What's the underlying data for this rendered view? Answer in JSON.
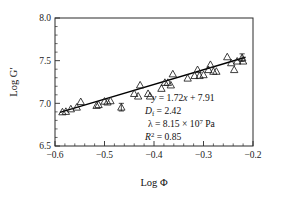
{
  "chart_data": {
    "type": "scatter",
    "title": "",
    "xlabel": "Log Φ",
    "ylabel": "Log G′",
    "xlim": [
      -0.6,
      -0.2
    ],
    "ylim": [
      6.5,
      8.0
    ],
    "xticks": [
      -0.6,
      -0.5,
      -0.4,
      -0.3,
      -0.2
    ],
    "xticklabels": [
      "−0.6",
      "−0.5",
      "−0.4",
      "−0.3",
      "−0.2"
    ],
    "yticks": [
      6.5,
      7.0,
      7.5,
      8.0
    ],
    "yticklabels": [
      "6.5",
      "7.0",
      "7.5",
      "8.0"
    ],
    "x_minor_interval": 0.02,
    "y_minor_interval": 0.1,
    "grid": false,
    "legend": null,
    "marker_style": "open-triangle-up",
    "series": [
      {
        "name": "Log G′ vs Log Φ",
        "points": [
          {
            "x": -0.585,
            "y": 6.9
          },
          {
            "x": -0.578,
            "y": 6.905
          },
          {
            "x": -0.568,
            "y": 6.935
          },
          {
            "x": -0.556,
            "y": 6.955
          },
          {
            "x": -0.548,
            "y": 7.02
          },
          {
            "x": -0.516,
            "y": 6.975
          },
          {
            "x": -0.512,
            "y": 6.985
          },
          {
            "x": -0.5,
            "y": 7.025
          },
          {
            "x": -0.494,
            "y": 7.015
          },
          {
            "x": -0.488,
            "y": 7.03
          },
          {
            "x": -0.466,
            "y": 6.955,
            "yerr": 0.045
          },
          {
            "x": -0.44,
            "y": 7.115
          },
          {
            "x": -0.432,
            "y": 7.085
          },
          {
            "x": -0.428,
            "y": 7.215
          },
          {
            "x": -0.412,
            "y": 7.115
          },
          {
            "x": -0.408,
            "y": 7.085
          },
          {
            "x": -0.385,
            "y": 7.175
          },
          {
            "x": -0.378,
            "y": 7.245
          },
          {
            "x": -0.372,
            "y": 7.245
          },
          {
            "x": -0.366,
            "y": 7.215
          },
          {
            "x": -0.362,
            "y": 7.345
          },
          {
            "x": -0.332,
            "y": 7.295
          },
          {
            "x": -0.318,
            "y": 7.325
          },
          {
            "x": -0.312,
            "y": 7.395
          },
          {
            "x": -0.308,
            "y": 7.325
          },
          {
            "x": -0.3,
            "y": 7.335
          },
          {
            "x": -0.29,
            "y": 7.395
          },
          {
            "x": -0.286,
            "y": 7.455
          },
          {
            "x": -0.28,
            "y": 7.375
          },
          {
            "x": -0.274,
            "y": 7.375
          },
          {
            "x": -0.252,
            "y": 7.545
          },
          {
            "x": -0.244,
            "y": 7.475
          },
          {
            "x": -0.238,
            "y": 7.395
          },
          {
            "x": -0.232,
            "y": 7.495
          },
          {
            "x": -0.222,
            "y": 7.535,
            "yerr": 0.045
          },
          {
            "x": -0.22,
            "y": 7.495
          }
        ]
      }
    ],
    "fit_line": {
      "slope": 1.72,
      "intercept": 7.91,
      "x_start": -0.59,
      "x_end": -0.215
    },
    "annotations": {
      "equation_y": "y",
      "equation_rest": " = 1.72",
      "equation_x": "x",
      "equation_tail": " + 7.91",
      "df_symbol": "D",
      "df_sub": "f",
      "df_value": " = 2.42",
      "lambda_symbol": "λ",
      "lambda_value": " = 8.15 × 10",
      "lambda_exp": "7",
      "lambda_unit": " Pa",
      "r2_symbol": "R",
      "r2_sup": "2",
      "r2_value": " = 0.85"
    }
  },
  "colors": {
    "axis": "#2b2b2b",
    "marker": "#1c1c1c",
    "line": "#000000",
    "text": "#111111",
    "background": "#ffffff"
  }
}
